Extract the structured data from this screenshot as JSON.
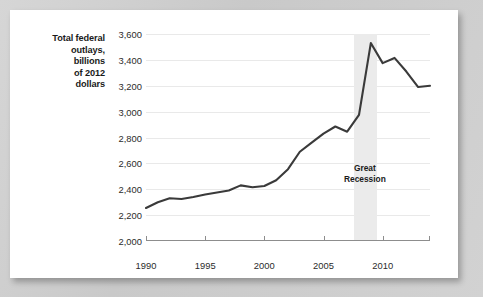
{
  "figure": {
    "axis_title_lines": [
      "Total federal",
      "outlays,",
      "billions",
      "of 2012",
      "dollars"
    ],
    "annotation_lines": [
      "Great",
      "Recession"
    ]
  },
  "chart_data": {
    "type": "line",
    "title": "",
    "subtitle": "",
    "xlabel": "",
    "ylabel": "Total federal outlays, billions of 2012 dollars",
    "xlim": [
      1990,
      2014
    ],
    "ylim": [
      2000,
      3600
    ],
    "grid": true,
    "legend": false,
    "line_color": "#3a3a3a",
    "band_color": "#ebebeb",
    "xticks": [
      1990,
      1995,
      2000,
      2005,
      2010
    ],
    "xtick_labels": [
      "1990",
      "1995",
      "2000",
      "2005",
      "2010"
    ],
    "yticks": [
      2000,
      2200,
      2400,
      2600,
      2800,
      3000,
      3200,
      3400,
      3600
    ],
    "ytick_labels": [
      "2,000",
      "2,200",
      "2,400",
      "2,600",
      "2,800",
      "3,000",
      "3,200",
      "3,400",
      "3,600"
    ],
    "annotations": [
      {
        "text": "Great Recession",
        "type": "shaded-band",
        "x_start": 2007.6,
        "x_end": 2009.5,
        "label_x": 2008.5,
        "label_y": 2560
      }
    ],
    "series": [
      {
        "name": "Total federal outlays",
        "x": [
          1990,
          1991,
          1992,
          1993,
          1994,
          1995,
          1996,
          1997,
          1998,
          1999,
          2000,
          2001,
          2002,
          2003,
          2004,
          2005,
          2006,
          2007,
          2008,
          2009,
          2010,
          2011,
          2012,
          2013,
          2014
        ],
        "values": [
          2255,
          2300,
          2330,
          2325,
          2340,
          2360,
          2375,
          2390,
          2430,
          2415,
          2425,
          2470,
          2555,
          2690,
          2760,
          2830,
          2885,
          2845,
          2975,
          3530,
          3375,
          3415,
          3310,
          3190,
          3200
        ]
      }
    ]
  }
}
